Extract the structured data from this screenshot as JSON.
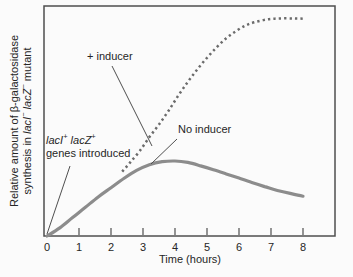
{
  "chart_data": {
    "type": "line",
    "title": "",
    "xlabel": "Time (hours)",
    "ylabel": "Relative amount of β-galactosidase synthesis in lacI− lacZ− mutant",
    "ylabel_line1": "Relative amount of β-galactosidase",
    "ylabel_line2_segments": [
      {
        "t": "synthesis in "
      },
      {
        "t": "lacI",
        "i": true
      },
      {
        "t": "−",
        "sup": true
      },
      {
        "t": " "
      },
      {
        "t": "lacZ",
        "i": true
      },
      {
        "t": "−",
        "sup": true
      },
      {
        "t": " mutant"
      }
    ],
    "x_ticks": [
      0,
      1,
      2,
      3,
      4,
      5,
      6,
      7,
      8
    ],
    "xlim": [
      0,
      9
    ],
    "ylim": [
      0,
      100
    ],
    "grid": false,
    "legend_position": "none",
    "series": [
      {
        "name": "+ inducer",
        "style": "dotted",
        "points": [
          [
            2.35,
            28
          ],
          [
            2.6,
            32
          ],
          [
            2.9,
            37
          ],
          [
            3.2,
            43
          ],
          [
            3.5,
            48.5
          ],
          [
            3.8,
            54.5
          ],
          [
            4.1,
            61
          ],
          [
            4.4,
            67
          ],
          [
            4.7,
            72.5
          ],
          [
            5.0,
            77.5
          ],
          [
            5.3,
            82
          ],
          [
            5.6,
            86
          ],
          [
            5.9,
            89
          ],
          [
            6.2,
            91.5
          ],
          [
            6.5,
            93
          ],
          [
            6.9,
            94.2
          ],
          [
            7.3,
            94.6
          ],
          [
            7.7,
            94.6
          ],
          [
            8.0,
            94.5
          ]
        ]
      },
      {
        "name": "No inducer",
        "style": "solid",
        "points": [
          [
            0,
            0
          ],
          [
            0.4,
            3.5
          ],
          [
            0.8,
            8
          ],
          [
            1.2,
            12.5
          ],
          [
            1.6,
            17
          ],
          [
            2.0,
            21
          ],
          [
            2.4,
            25
          ],
          [
            2.8,
            28.5
          ],
          [
            3.2,
            31
          ],
          [
            3.6,
            32.3
          ],
          [
            4.0,
            32.6
          ],
          [
            4.4,
            32
          ],
          [
            4.8,
            30.5
          ],
          [
            5.2,
            28.8
          ],
          [
            5.6,
            27
          ],
          [
            6.0,
            25.2
          ],
          [
            6.4,
            23.3
          ],
          [
            6.8,
            21.5
          ],
          [
            7.2,
            19.8
          ],
          [
            7.6,
            18.5
          ],
          [
            8.0,
            17.3
          ]
        ]
      }
    ],
    "annotations": [
      {
        "id": "plus-inducer",
        "text": "+ inducer"
      },
      {
        "id": "no-inducer",
        "text": "No inducer"
      },
      {
        "id": "genes-introduced",
        "line1_segments": [
          {
            "t": "lacI",
            "i": true
          },
          {
            "t": "+",
            "sup": true
          },
          {
            "t": " "
          },
          {
            "t": "lacZ",
            "i": true
          },
          {
            "t": "+",
            "sup": true
          }
        ],
        "line2": "genes introduced"
      }
    ]
  },
  "colors": {
    "background": "#fbfbfb",
    "axis": "#4f4f4f",
    "text": "#262626",
    "curve_solid": "#8c8c8c",
    "curve_dotted": "#6b6b6b",
    "leader_line": "#4f4f4f"
  }
}
